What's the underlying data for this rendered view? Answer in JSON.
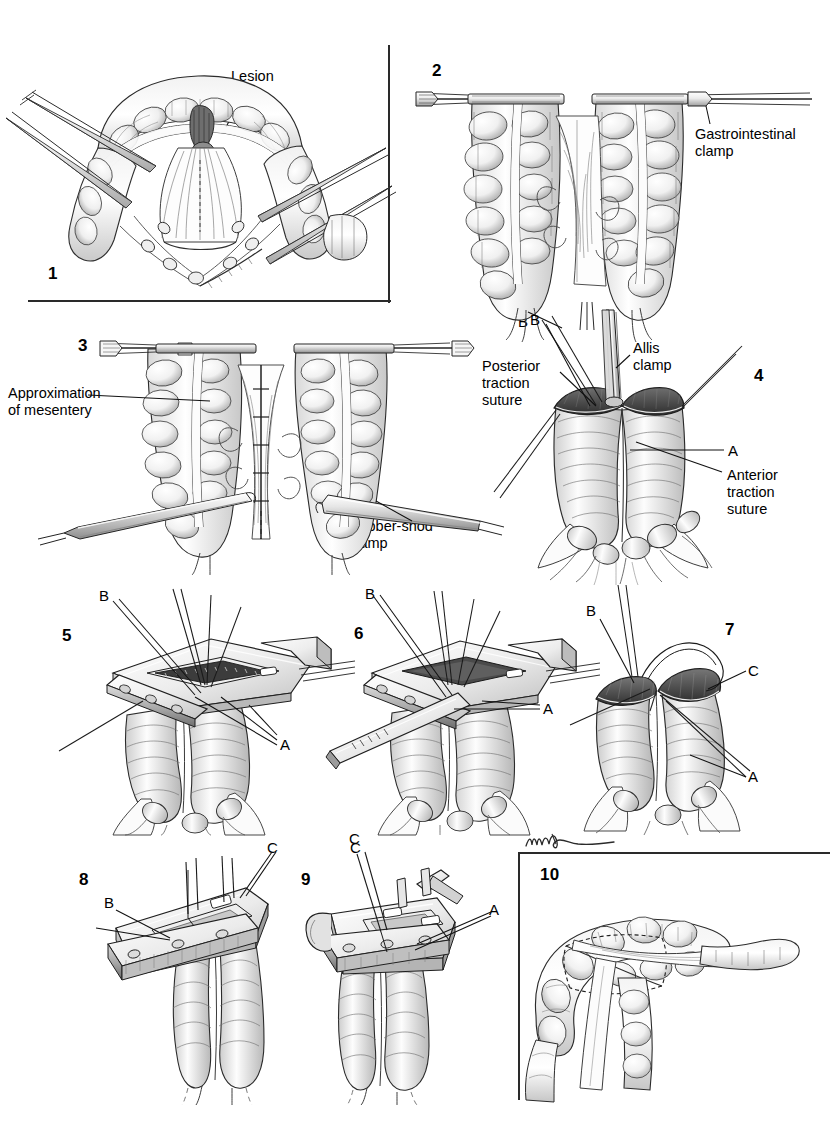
{
  "plate": {
    "title": "Functional end-to-end stapled intestinal anastomosis",
    "width": 838,
    "height": 1131,
    "background": "#ffffff",
    "ink": "#1a1a1a",
    "style": "pen-and-ink medical illustration, grayscale wash",
    "signature": "artist-signature"
  },
  "panels": [
    {
      "id": 1,
      "number": "1",
      "framed": true,
      "labels": [
        {
          "name": "lesion",
          "text": "Lesion"
        }
      ],
      "markers": [],
      "caption": "Bowel segment with lesion, mesentery fan divided between clamps"
    },
    {
      "id": 2,
      "number": "2",
      "framed": false,
      "labels": [
        {
          "name": "gastrointestinal-clamp",
          "text": "Gastrointestinal\nclamp"
        }
      ],
      "markers": [
        {
          "name": "marker-b",
          "text": "B"
        }
      ],
      "caption": "Two bowel limbs occluded with gastrointestinal clamps"
    },
    {
      "id": 3,
      "number": "3",
      "framed": false,
      "labels": [
        {
          "name": "approximation-of-mesentery",
          "text": "Approximation\nof mesentery"
        },
        {
          "name": "rubber-shod-clamp",
          "text": "Rubber-shod\nclamp"
        }
      ],
      "markers": [],
      "caption": "Mesenteric borders approximated with interrupted sutures"
    },
    {
      "id": 4,
      "number": "4",
      "framed": false,
      "labels": [
        {
          "name": "posterior-traction-suture",
          "text": "Posterior\ntraction\nsuture"
        },
        {
          "name": "allis-clamp",
          "text": "Allis\nclamp"
        },
        {
          "name": "anterior-traction-suture",
          "text": "Anterior\ntraction\nsuture"
        }
      ],
      "markers": [
        {
          "name": "marker-b",
          "text": "B"
        },
        {
          "name": "marker-a",
          "text": "A"
        }
      ],
      "caption": "Open bowel ends held by Allis clamp and traction sutures"
    },
    {
      "id": 5,
      "number": "5",
      "framed": false,
      "labels": [],
      "markers": [
        {
          "name": "marker-b",
          "text": "B"
        },
        {
          "name": "marker-a",
          "text": "A"
        }
      ],
      "caption": "Linear cutting stapler inserted into both limbs"
    },
    {
      "id": 6,
      "number": "6",
      "framed": false,
      "labels": [],
      "markers": [
        {
          "name": "marker-b",
          "text": "B"
        },
        {
          "name": "marker-a",
          "text": "A"
        },
        {
          "name": "marker-c",
          "text": "C"
        }
      ],
      "caption": "Stapler fired creating the side-to-side anastomosis"
    },
    {
      "id": 7,
      "number": "7",
      "framed": false,
      "labels": [],
      "markers": [
        {
          "name": "marker-b",
          "text": "B"
        },
        {
          "name": "marker-c",
          "text": "C"
        },
        {
          "name": "marker-a",
          "text": "A"
        }
      ],
      "caption": "Common enterotomy held open by traction sutures"
    },
    {
      "id": 8,
      "number": "8",
      "framed": false,
      "labels": [],
      "markers": [
        {
          "name": "marker-c",
          "text": "C"
        },
        {
          "name": "marker-b",
          "text": "B"
        }
      ],
      "caption": "Transverse stapler applied across the common opening"
    },
    {
      "id": 9,
      "number": "9",
      "framed": false,
      "labels": [],
      "markers": [
        {
          "name": "marker-c",
          "text": "C"
        },
        {
          "name": "marker-a",
          "text": "A"
        }
      ],
      "caption": "Stapler closing the common enterotomy, sutures incorporated"
    },
    {
      "id": 10,
      "number": "10",
      "framed": true,
      "labels": [],
      "markers": [],
      "caption": "Completed functional end-to-end anastomosis"
    }
  ]
}
